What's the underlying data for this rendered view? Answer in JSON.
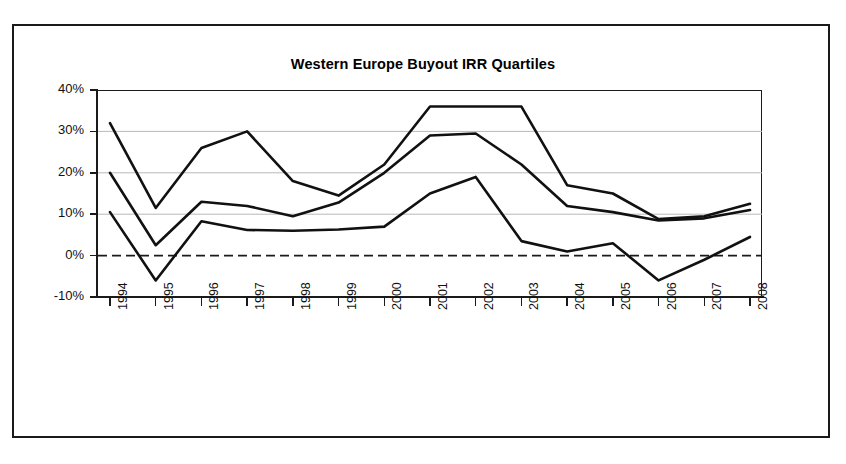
{
  "chart_data": {
    "type": "line",
    "title": "Western Europe Buyout IRR Quartiles",
    "xlabel": "",
    "ylabel": "",
    "categories": [
      "1994",
      "1995",
      "1996",
      "1997",
      "1998",
      "1999",
      "2000",
      "2001",
      "2002",
      "2003",
      "2004",
      "2005",
      "2006",
      "2007",
      "2008"
    ],
    "ylim": [
      -10,
      40
    ],
    "yticks": [
      40,
      30,
      20,
      10,
      0,
      -10
    ],
    "ytick_labels": [
      "40%",
      "30%",
      "20%",
      "10%",
      "0%",
      "-10%"
    ],
    "grid": true,
    "grid_values": [
      30,
      20,
      10
    ],
    "zero_line": 0,
    "zero_line_style": "dashed",
    "legend": "none",
    "series": [
      {
        "name": "Top Quartile",
        "values": [
          32,
          11.5,
          26,
          30,
          18,
          14.5,
          22,
          36,
          36,
          36,
          17,
          15,
          8.8,
          9.5,
          12.5
        ]
      },
      {
        "name": "Median",
        "values": [
          20,
          2.5,
          13,
          12,
          9.5,
          12.8,
          20,
          29,
          29.5,
          22,
          12,
          10.5,
          8.5,
          9,
          11
        ]
      },
      {
        "name": "Bottom Quartile",
        "values": [
          10.5,
          -6,
          8.3,
          6.2,
          6,
          6.3,
          7,
          15,
          19,
          3.5,
          1,
          3,
          -6,
          -1,
          4.5
        ]
      }
    ]
  }
}
